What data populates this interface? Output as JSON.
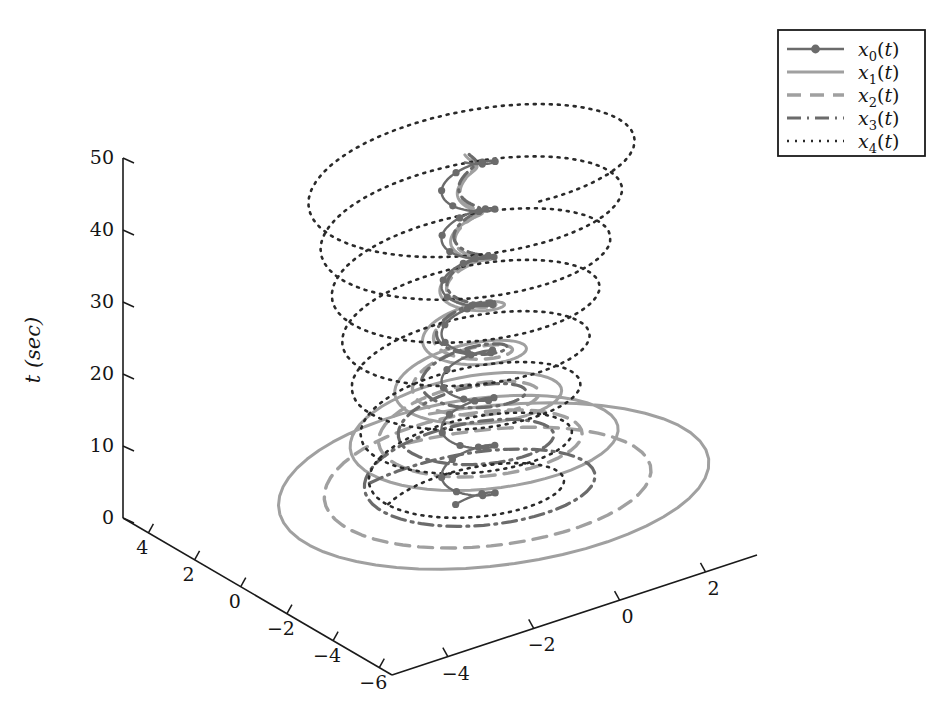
{
  "figure": {
    "type": "3d-line-plot",
    "background": "#ffffff",
    "width": 939,
    "height": 716
  },
  "axes": {
    "vertical": {
      "name": "t-axis",
      "title": "t (sec)",
      "ticks": [
        "0",
        "10",
        "20",
        "30",
        "40",
        "50"
      ],
      "values": [
        0,
        10,
        20,
        30,
        40,
        50
      ],
      "range": [
        0,
        50
      ]
    },
    "depth_left": {
      "name": "x-axis",
      "title": "",
      "ticks": [
        "4",
        "2",
        "0",
        "-2",
        "-4",
        "-6"
      ],
      "values": [
        4,
        2,
        0,
        -2,
        -4,
        -6
      ],
      "range": [
        -6,
        5
      ]
    },
    "depth_right": {
      "name": "y-axis",
      "title": "",
      "ticks": [
        "-4",
        "-2",
        "0",
        "2"
      ],
      "values": [
        -4,
        -2,
        0,
        2
      ],
      "range": [
        -5,
        3
      ]
    }
  },
  "legend": {
    "position": "top-right",
    "border_color": "#1a1a1a",
    "entries": [
      {
        "base": "x",
        "sub": "0",
        "suffix": "(t)",
        "label": "x0(t)",
        "style": "solid-marker",
        "color": "#6b6b6b",
        "width": 2.4,
        "dash": "none",
        "marker": "circle"
      },
      {
        "base": "x",
        "sub": "1",
        "suffix": "(t)",
        "label": "x1(t)",
        "style": "solid",
        "color": "#a0a0a0",
        "width": 3.0,
        "dash": "none",
        "marker": "none"
      },
      {
        "base": "x",
        "sub": "2",
        "suffix": "(t)",
        "label": "x2(t)",
        "style": "dashed",
        "color": "#a0a0a0",
        "width": 3.4,
        "dash": "14,9",
        "marker": "none"
      },
      {
        "base": "x",
        "sub": "3",
        "suffix": "(t)",
        "label": "x3(t)",
        "style": "dash-dot",
        "color": "#6b6b6b",
        "width": 3.2,
        "dash": "14,6,2,6",
        "marker": "none"
      },
      {
        "base": "x",
        "sub": "4",
        "suffix": "(t)",
        "label": "x4(t)",
        "style": "dotted",
        "color": "#2a2a2a",
        "width": 2.6,
        "dash": "2,6",
        "marker": "none"
      }
    ]
  },
  "chart_data": {
    "type": "line",
    "title": "",
    "xlabel": "",
    "ylabel": "t (sec)",
    "zlabel": "",
    "projection": "3d-isometric",
    "xlim": [
      -6,
      5
    ],
    "ylim": [
      -5,
      3
    ],
    "tlim": [
      0,
      50
    ],
    "grid": false,
    "legend_position": "top-right",
    "series": [
      {
        "name": "x0(t)",
        "r0": 0.55,
        "decay": 0.0,
        "phase": 0.0,
        "turns": 7.6,
        "cx": 0.0,
        "cy": 0.0,
        "color": "#6b6b6b",
        "dash": "none",
        "marker": "circle",
        "width": 2.4,
        "n": 420
      },
      {
        "name": "x1(t)",
        "r0": 5.6,
        "decay": 0.072,
        "phase": 0.35,
        "turns": 7.6,
        "cx": 0.0,
        "cy": 0.0,
        "color": "#a0a0a0",
        "dash": "none",
        "marker": "none",
        "width": 3.0,
        "n": 420
      },
      {
        "name": "x2(t)",
        "r0": 4.3,
        "decay": 0.072,
        "phase": 0.2,
        "turns": 7.6,
        "cx": 0.0,
        "cy": 0.0,
        "color": "#a0a0a0",
        "dash": "14,9",
        "marker": "none",
        "width": 3.4,
        "n": 420
      },
      {
        "name": "x3(t)",
        "r0": 3.0,
        "decay": 0.06,
        "phase": -0.25,
        "turns": 7.6,
        "cx": 0.0,
        "cy": 0.0,
        "color": "#6b6b6b",
        "dash": "14,6,2,6",
        "marker": "none",
        "width": 3.2,
        "n": 420
      },
      {
        "name": "x4(t)",
        "r0": 1.9,
        "decay": -0.012,
        "phase": -0.55,
        "turns": 7.6,
        "cx": 0.0,
        "cy": 0.0,
        "color": "#2a2a2a",
        "dash": "2,6",
        "marker": "none",
        "width": 2.6,
        "n": 420
      }
    ]
  },
  "geometry": {
    "origin_x": 392,
    "origin_y": 675,
    "t_axis_x": 123,
    "t_top_y": 158,
    "t_bottom_y": 518,
    "left_end_x": 123,
    "left_end_y": 518,
    "right_end_x": 757,
    "right_end_y": 555
  }
}
